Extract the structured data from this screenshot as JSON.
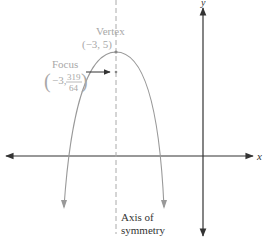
{
  "diagram": {
    "type": "parabola-graph",
    "colors": {
      "axes": "#333333",
      "parabola": "#999999",
      "symmetry_axis": "#aaaaaa",
      "labels_gray": "#a8a8a8",
      "labels_dark": "#333333"
    },
    "axes": {
      "x_label": "x",
      "y_label": "y"
    },
    "vertex": {
      "title": "Vertex",
      "coords": "(−3, 5)"
    },
    "focus": {
      "title": "Focus",
      "x": "−3,",
      "numerator": "319",
      "denominator": "64",
      "open_paren": "(",
      "close_paren": ")"
    },
    "axis_of_symmetry": {
      "line1": "Axis of",
      "line2": "symmetry"
    }
  }
}
